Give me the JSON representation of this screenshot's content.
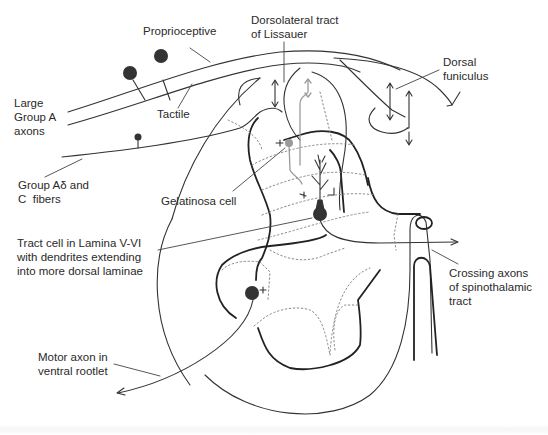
{
  "diagram": {
    "labels": {
      "proprioceptive": "Proprioceptive",
      "large_group_a": "Large\nGroup A\naxons",
      "tactile": "Tactile",
      "group_a_delta_c": "Group Aδ and\nC  fibers",
      "dorsolateral_tract": "Dorsolateral tract\nof Lissauer",
      "dorsal_funiculus": "Dorsal\nfuniculus",
      "gelatinosa_cell": "Gelatinosa cell",
      "tract_cell": "Tract cell in Lamina V-VI\nwith dendrites extending\ninto more dorsal laminae",
      "crossing_axons": "Crossing axons\nof spinothalamic\ntract",
      "motor_axon": "Motor axon in\nventral rootlet"
    },
    "colors": {
      "line": "#333333",
      "grey_neuron": "#9a9a9a",
      "background": "#ffffff"
    }
  }
}
